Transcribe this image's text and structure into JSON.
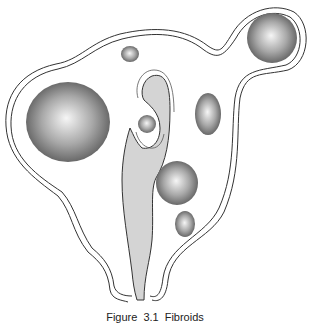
{
  "figure": {
    "caption": {
      "label": "Figure",
      "number": "3.1",
      "title": "Fibroids"
    },
    "colors": {
      "outline": "#333333",
      "cavity_fill": "#d4d4d4",
      "fibroid_light": "#f4f4f4",
      "fibroid_dark": "#5a5a5a",
      "background": "#ffffff"
    },
    "fibroids": [
      {
        "name": "subserosal-left-large",
        "cx": 68,
        "cy": 122,
        "rx": 42,
        "ry": 40
      },
      {
        "name": "pedunculated-right-top",
        "cx": 272,
        "cy": 38,
        "rx": 25,
        "ry": 25
      },
      {
        "name": "intramural-top-small",
        "cx": 130,
        "cy": 54,
        "rx": 9,
        "ry": 8
      },
      {
        "name": "submucosal-center",
        "cx": 147,
        "cy": 124,
        "rx": 9,
        "ry": 9
      },
      {
        "name": "intramural-right",
        "cx": 208,
        "cy": 114,
        "rx": 13,
        "ry": 21
      },
      {
        "name": "intramural-lower-right",
        "cx": 177,
        "cy": 183,
        "rx": 21,
        "ry": 22
      },
      {
        "name": "intramural-bottom-right",
        "cx": 185,
        "cy": 224,
        "rx": 10,
        "ry": 13
      }
    ]
  }
}
